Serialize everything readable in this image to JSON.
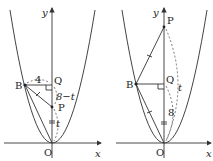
{
  "panels": [
    {
      "id": "left",
      "labels": {
        "y_axis": "y",
        "x_axis": "x",
        "origin": "O",
        "point_b": "B",
        "point_q": "Q",
        "point_p": "P",
        "bq_length": "4",
        "qp_length": "8−t",
        "po_length": "t"
      }
    },
    {
      "id": "right",
      "labels": {
        "y_axis": "y",
        "x_axis": "x",
        "origin": "O",
        "point_b": "B",
        "point_q": "Q",
        "point_p": "P",
        "po_length": "t",
        "qo_length": "8"
      }
    }
  ]
}
